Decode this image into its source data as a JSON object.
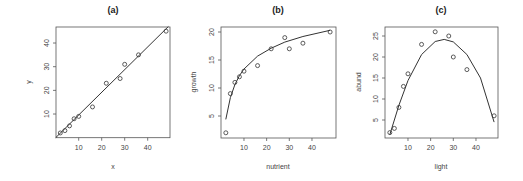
{
  "chart_data": [
    {
      "type": "scatter",
      "title": "(a)",
      "xlabel": "x",
      "ylabel": "y",
      "xlim": [
        0,
        49
      ],
      "ylim": [
        0,
        47
      ],
      "xticks": [
        10,
        20,
        30,
        40
      ],
      "yticks": [
        10,
        20,
        30,
        40
      ],
      "x": [
        2,
        4,
        6,
        8,
        10,
        16,
        22,
        28,
        30,
        36,
        48
      ],
      "y": [
        2,
        3,
        5,
        8,
        9,
        13,
        23,
        25,
        31,
        35,
        45
      ],
      "fit": {
        "model": "linear",
        "description": "straight line y ≈ 0.96x",
        "x": [
          0,
          49
        ],
        "y": [
          0,
          47
        ]
      },
      "grid": false,
      "legend": null,
      "box": {
        "x0": 56,
        "y0": 27,
        "x1": 170,
        "y1": 137.7
      },
      "scale": {
        "x_origin_px": 55.7,
        "x_px_per_unit": 2.3,
        "y_origin_px": 137.7,
        "y_px_per_unit": 2.367
      }
    },
    {
      "type": "scatter",
      "title": "(b)",
      "xlabel": "nutrient",
      "ylabel": "growth",
      "xlim": [
        0,
        50
      ],
      "ylim": [
        1,
        21
      ],
      "xticks": [
        10,
        20,
        30,
        40
      ],
      "yticks": [
        5,
        10,
        15,
        20
      ],
      "x": [
        2,
        4,
        6,
        8,
        10,
        16,
        22,
        28,
        30,
        36,
        48
      ],
      "y": [
        2,
        9,
        11,
        12,
        13,
        14,
        17,
        19,
        17,
        18,
        20
      ],
      "fit": {
        "model": "log",
        "description": "saturating log curve",
        "x": [
          2,
          4,
          6,
          8,
          10,
          16,
          22,
          28,
          36,
          48
        ],
        "y": [
          4.4,
          8.3,
          10.6,
          12.2,
          13.4,
          15.7,
          17.1,
          18.2,
          19.2,
          20.3
        ]
      },
      "grid": false,
      "legend": null,
      "box": {
        "x0": 221,
        "y0": 27,
        "x1": 336,
        "y1": 138
      },
      "scale": {
        "x_origin_px": 221.3,
        "x_px_per_unit": 2.267,
        "y_origin_px": 144,
        "y_px_per_unit": 5.6
      }
    },
    {
      "type": "scatter",
      "title": "(c)",
      "xlabel": "light",
      "ylabel": "abund",
      "xlim": [
        0,
        50
      ],
      "ylim": [
        1,
        27
      ],
      "xticks": [
        10,
        20,
        30,
        40
      ],
      "yticks": [
        5,
        10,
        15,
        20,
        25
      ],
      "x": [
        2,
        4,
        6,
        8,
        10,
        16,
        22,
        28,
        30,
        36,
        48
      ],
      "y": [
        2,
        3,
        8,
        13,
        16,
        23,
        26,
        25,
        20,
        17,
        6
      ],
      "fit": {
        "model": "quadratic",
        "description": "hump-shaped parabola peaking ~24 near x≈26",
        "x": [
          2,
          6,
          10,
          16,
          22,
          26,
          30,
          36,
          42,
          48
        ],
        "y": [
          1.5,
          8.5,
          14.4,
          20.6,
          23.7,
          24.2,
          23.6,
          20.6,
          15.0,
          4.5
        ]
      },
      "grid": false,
      "legend": null,
      "box": {
        "x0": 385,
        "y0": 27,
        "x1": 498,
        "y1": 138
      },
      "scale": {
        "x_origin_px": 385.3,
        "x_px_per_unit": 2.267,
        "y_origin_px": 141,
        "y_px_per_unit": 4.2
      }
    }
  ]
}
